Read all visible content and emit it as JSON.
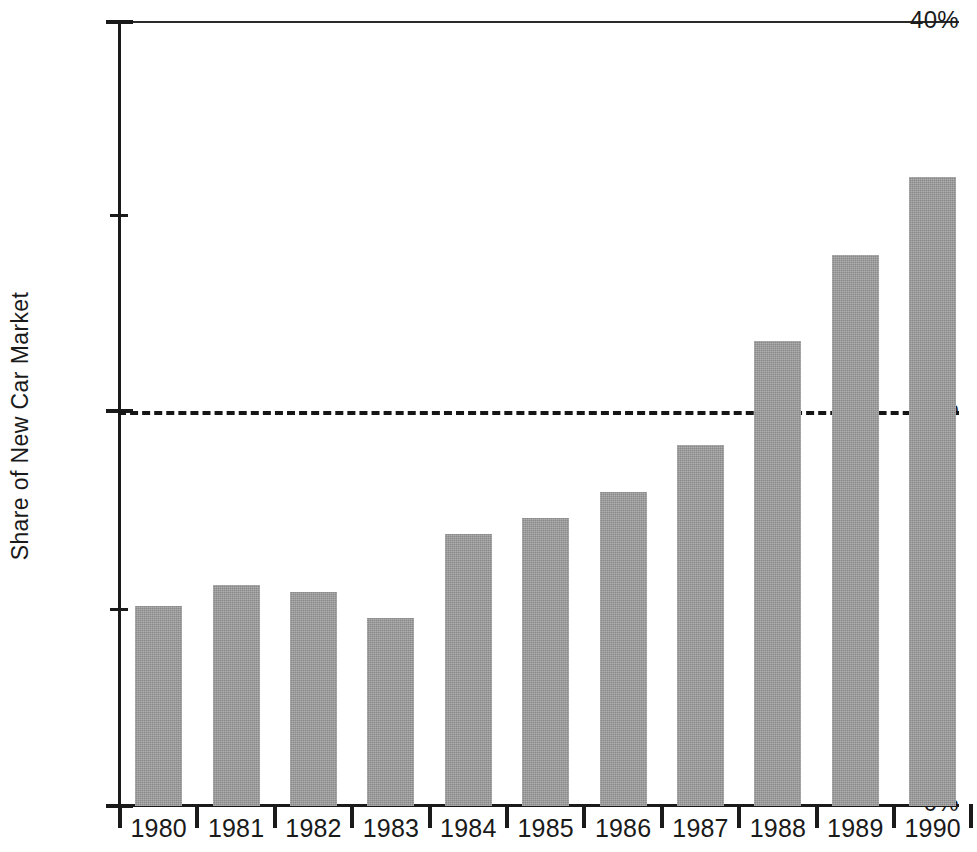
{
  "chart_data": {
    "type": "bar",
    "title": "",
    "subtitle": "",
    "xlabel": "",
    "ylabel": "Share of New Car Market",
    "categories": [
      "1980",
      "1981",
      "1982",
      "1983",
      "1984",
      "1985",
      "1986",
      "1987",
      "1988",
      "1989",
      "1990"
    ],
    "values": [
      10.2,
      11.3,
      10.9,
      9.6,
      13.9,
      14.7,
      16.0,
      18.4,
      23.7,
      28.1,
      32.1
    ],
    "series": [
      {
        "name": "Share of New Car Market",
        "values": [
          10.2,
          11.3,
          10.9,
          9.6,
          13.9,
          14.7,
          16.0,
          18.4,
          23.7,
          28.1,
          32.1
        ]
      }
    ],
    "ylim": [
      0,
      40
    ],
    "y_ticks": [
      0,
      10,
      20,
      30,
      40
    ],
    "y_tick_labels": [
      "0%",
      "",
      "20%",
      "",
      "40%"
    ],
    "grid": false,
    "legend": null,
    "legend_position": "none",
    "annotations": [
      {
        "type": "horizontal-reference-line",
        "value": 20,
        "label": "",
        "style": "dashed"
      }
    ],
    "bar_color": "#9a9a9a",
    "axis_color": "#1a1a1a",
    "background_color": "#ffffff",
    "note": "Rightmost bar (1990) is clipped by the right edge of the image."
  },
  "axis": {
    "y_title": "Share of New Car Market",
    "y_labels": {
      "top": "40%",
      "mid": "20%",
      "bottom": "0%"
    }
  }
}
